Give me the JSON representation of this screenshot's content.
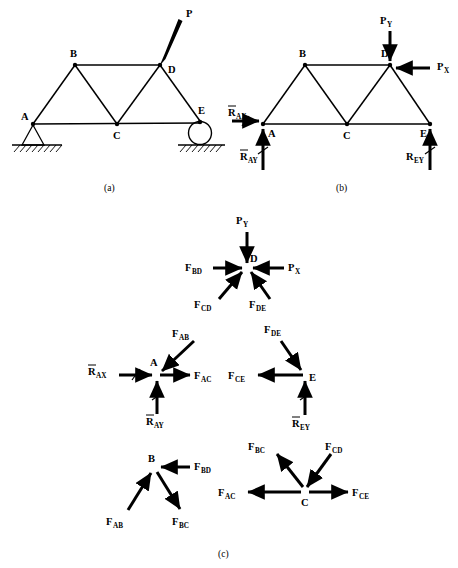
{
  "figure": {
    "panels": [
      {
        "id": "a",
        "caption": "(a)",
        "description": "Truss geometry with pin support at A, roller support at E, and applied load P at joint D",
        "nodes": [
          {
            "label": "A",
            "x": 33,
            "y": 124
          },
          {
            "label": "B",
            "x": 75,
            "y": 65
          },
          {
            "label": "C",
            "x": 117,
            "y": 124
          },
          {
            "label": "D",
            "x": 160,
            "y": 65
          },
          {
            "label": "E",
            "x": 200,
            "y": 120
          }
        ],
        "node_label_positions": [
          {
            "label": "A",
            "x": 21,
            "y": 120
          },
          {
            "label": "B",
            "x": 71,
            "y": 56
          },
          {
            "label": "C",
            "x": 114,
            "y": 138
          },
          {
            "label": "D",
            "x": 168,
            "y": 72
          },
          {
            "label": "E",
            "x": 200,
            "y": 114
          }
        ],
        "members": [
          [
            "A",
            "B"
          ],
          [
            "B",
            "C"
          ],
          [
            "C",
            "D"
          ],
          [
            "D",
            "E"
          ],
          [
            "A",
            "C"
          ],
          [
            "C",
            "E"
          ],
          [
            "B",
            "D"
          ]
        ],
        "loads": [
          {
            "label": "P",
            "label_x": 188,
            "label_y": 16,
            "from_x": 181,
            "from_y": 22,
            "to_x": 162,
            "to_y": 63
          }
        ],
        "supports": [
          {
            "type": "pin",
            "at": "A"
          },
          {
            "type": "roller",
            "at": "E"
          }
        ]
      },
      {
        "id": "b",
        "caption": "(b)",
        "description": "Free-body diagram of the whole truss showing reaction forces and applied load components",
        "nodes": [
          {
            "label": "A",
            "x": 263,
            "y": 124
          },
          {
            "label": "B",
            "x": 305,
            "y": 65
          },
          {
            "label": "C",
            "x": 347,
            "y": 124
          },
          {
            "label": "D",
            "x": 390,
            "y": 65
          },
          {
            "label": "E",
            "x": 430,
            "y": 124
          }
        ],
        "node_label_positions": [
          {
            "label": "A",
            "x": 268,
            "y": 136
          },
          {
            "label": "B",
            "x": 299,
            "y": 56
          },
          {
            "label": "C",
            "x": 344,
            "y": 138
          },
          {
            "label": "D",
            "x": 384,
            "y": 56
          },
          {
            "label": "E",
            "x": 424,
            "y": 136
          }
        ],
        "members": [
          [
            "A",
            "B"
          ],
          [
            "B",
            "C"
          ],
          [
            "C",
            "D"
          ],
          [
            "D",
            "E"
          ],
          [
            "A",
            "C"
          ],
          [
            "C",
            "E"
          ],
          [
            "B",
            "D"
          ]
        ],
        "forces": [
          {
            "base": "P",
            "sub": "Y",
            "overbar": false,
            "label_x": 382,
            "label_y": 22,
            "dir": "down"
          },
          {
            "base": "P",
            "sub": "X",
            "overbar": false,
            "label_x": 438,
            "label_y": 68,
            "dir": "left"
          },
          {
            "base": "R",
            "sub": "AX",
            "overbar": true,
            "label_x": 238,
            "label_y": 112,
            "dir": "right"
          },
          {
            "base": "R",
            "sub": "AY",
            "overbar": true,
            "label_x": 243,
            "label_y": 160,
            "dir": "up"
          },
          {
            "base": "R",
            "sub": "EY",
            "overbar": false,
            "label_x": 410,
            "label_y": 160,
            "dir": "up"
          }
        ]
      },
      {
        "id": "c",
        "caption": "(c)",
        "description": "Free-body diagrams of individual joints D, A, E, B, and C",
        "joints": [
          {
            "label": "D",
            "x": 247,
            "y": 267,
            "label_x": 252,
            "label_y": 260,
            "forces": [
              {
                "base": "P",
                "sub": "Y",
                "overbar": false,
                "label_x": 238,
                "label_y": 222,
                "toward": true
              },
              {
                "base": "P",
                "sub": "X",
                "overbar": false,
                "label_x": 288,
                "label_y": 268,
                "toward": true
              },
              {
                "base": "F",
                "sub": "BD",
                "overbar": false,
                "label_x": 196,
                "label_y": 268,
                "toward": true
              },
              {
                "base": "F",
                "sub": "CD",
                "overbar": false,
                "label_x": 199,
                "label_y": 305,
                "toward": true
              },
              {
                "base": "F",
                "sub": "DE",
                "overbar": false,
                "label_x": 253,
                "label_y": 305,
                "toward": true
              }
            ]
          },
          {
            "label": "A",
            "x": 157,
            "y": 375,
            "label_x": 154,
            "label_y": 364,
            "forces": [
              {
                "base": "R",
                "sub": "AX",
                "overbar": true,
                "label_x": 90,
                "label_y": 371,
                "toward": true
              },
              {
                "base": "R",
                "sub": "AY",
                "overbar": true,
                "label_x": 147,
                "label_y": 422,
                "toward": true
              },
              {
                "base": "F",
                "sub": "AB",
                "overbar": false,
                "label_x": 177,
                "label_y": 334,
                "toward": true
              },
              {
                "base": "F",
                "sub": "AC",
                "overbar": false,
                "label_x": 196,
                "label_y": 378,
                "toward": false
              }
            ]
          },
          {
            "label": "E",
            "x": 305,
            "y": 375,
            "label_x": 311,
            "label_y": 380,
            "forces": [
              {
                "base": "F",
                "sub": "DE",
                "overbar": false,
                "label_x": 268,
                "label_y": 330,
                "toward": true
              },
              {
                "base": "F",
                "sub": "CE",
                "overbar": false,
                "label_x": 232,
                "label_y": 372,
                "toward": true
              },
              {
                "base": "R",
                "sub": "EY",
                "overbar": true,
                "label_x": 295,
                "label_y": 424,
                "toward": true
              }
            ]
          },
          {
            "label": "B",
            "x": 155,
            "y": 467,
            "label_x": 149,
            "label_y": 460,
            "forces": [
              {
                "base": "F",
                "sub": "BD",
                "overbar": false,
                "label_x": 186,
                "label_y": 464,
                "toward": true
              },
              {
                "base": "F",
                "sub": "AB",
                "overbar": false,
                "label_x": 110,
                "label_y": 522,
                "toward": true
              },
              {
                "base": "F",
                "sub": "BC",
                "overbar": false,
                "label_x": 175,
                "label_y": 523,
                "toward": false
              }
            ]
          },
          {
            "label": "C",
            "x": 305,
            "y": 492,
            "label_x": 302,
            "label_y": 506,
            "forces": [
              {
                "base": "F",
                "sub": "BC",
                "overbar": false,
                "label_x": 252,
                "label_y": 448,
                "toward": false
              },
              {
                "base": "F",
                "sub": "CD",
                "overbar": false,
                "label_x": 322,
                "label_y": 448,
                "toward": true
              },
              {
                "base": "F",
                "sub": "AC",
                "overbar": false,
                "label_x": 222,
                "label_y": 495,
                "toward": false
              },
              {
                "base": "F",
                "sub": "CE",
                "overbar": false,
                "label_x": 354,
                "label_y": 495,
                "toward": false
              }
            ]
          }
        ]
      }
    ],
    "labels": {
      "node_A": "A",
      "node_B": "B",
      "node_C": "C",
      "node_D": "D",
      "node_E": "E",
      "load_P": "P",
      "load_PY_base": "P",
      "load_PY_sub": "Y",
      "load_PX_base": "P",
      "load_PX_sub": "X",
      "reaction_RAX_base": "R",
      "reaction_RAX_sub": "AX",
      "reaction_RAY_base": "R",
      "reaction_RAY_sub": "AY",
      "reaction_REY_base": "R",
      "reaction_REY_sub": "EY",
      "force_FAB_base": "F",
      "force_FAB_sub": "AB",
      "force_FAC_base": "F",
      "force_FAC_sub": "AC",
      "force_FBC_base": "F",
      "force_FBC_sub": "BC",
      "force_FBD_base": "F",
      "force_FBD_sub": "BD",
      "force_FCD_base": "F",
      "force_FCD_sub": "CD",
      "force_FCE_base": "F",
      "force_FCE_sub": "CE",
      "force_FDE_base": "F",
      "force_FDE_sub": "DE",
      "caption_a": "(a)",
      "caption_b": "(b)",
      "caption_c": "(c)"
    },
    "colors": {
      "ink": "#000000",
      "background": "#ffffff"
    }
  }
}
